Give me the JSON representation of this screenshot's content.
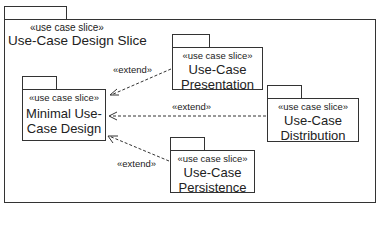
{
  "frame": {
    "stereotype": "«use case slice»",
    "title": "Use-Case Design Slice"
  },
  "packages": [
    {
      "id": "minimal",
      "stereotype": "«use case slice»",
      "name_line1": "Minimal Use-",
      "name_line2": "Case Design"
    },
    {
      "id": "presentation",
      "stereotype": "«use case slice»",
      "name_line1": "Use-Case",
      "name_line2": "Presentation"
    },
    {
      "id": "distribution",
      "stereotype": "«use case slice»",
      "name_line1": "Use-Case",
      "name_line2": "Distribution"
    },
    {
      "id": "persistence",
      "stereotype": "«use case slice»",
      "name_line1": "Use-Case",
      "name_line2": "Persistence"
    }
  ],
  "relationships": [
    {
      "from": "presentation",
      "to": "minimal",
      "label": "«extend»",
      "style": "dashed-arrow"
    },
    {
      "from": "distribution",
      "to": "minimal",
      "label": "«extend»",
      "style": "dashed-arrow"
    },
    {
      "from": "persistence",
      "to": "minimal",
      "label": "«extend»",
      "style": "dashed-arrow"
    }
  ],
  "colors": {
    "line": "#333333",
    "text": "#222222",
    "background": "#ffffff"
  }
}
